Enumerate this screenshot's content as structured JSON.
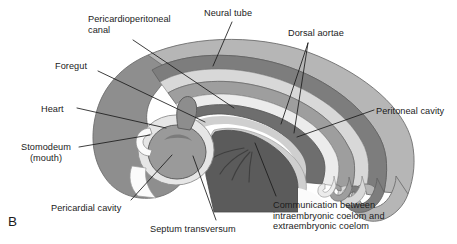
{
  "figure": {
    "panel_letter": "B",
    "background_color": "#ffffff",
    "width": 457,
    "height": 244
  },
  "palette": {
    "outer_ectoderm": "#b6b6b6",
    "mesoderm_body_wall": "#8e8e8e",
    "dark_tissue": "#6e6e6e",
    "septum_transversum": "#5e5e5e",
    "coelom_light": "#d6d6d6",
    "lumen_white": "#fbfbfb",
    "heart_fill": "#9a9a9a",
    "neural_tube_fill": "#9e9e9e",
    "outline": "#5a5a5a",
    "leader_line": "#1b1b1b",
    "text": "#1b1b1b"
  },
  "labels": [
    {
      "id": "pericardioperitoneal-canal",
      "text": "Pericardioperitoneal\ncanal",
      "x": 88,
      "y": 14,
      "align": "left"
    },
    {
      "id": "neural-tube",
      "text": "Neural tube",
      "x": 204,
      "y": 8,
      "align": "left"
    },
    {
      "id": "dorsal-aortae",
      "text": "Dorsal aortae",
      "x": 288,
      "y": 28,
      "align": "left"
    },
    {
      "id": "foregut",
      "text": "Foregut",
      "x": 55,
      "y": 61,
      "align": "left"
    },
    {
      "id": "heart",
      "text": "Heart",
      "x": 41,
      "y": 104,
      "align": "left"
    },
    {
      "id": "peritoneal-cavity",
      "text": "Peritoneal cavity",
      "x": 376,
      "y": 106,
      "align": "left"
    },
    {
      "id": "stomodeum",
      "text": "Stomodeum\n(mouth)",
      "x": 14,
      "y": 142,
      "align": "left"
    },
    {
      "id": "pericardial-cavity",
      "text": "Pericardial cavity",
      "x": 51,
      "y": 203,
      "align": "left"
    },
    {
      "id": "septum-transversum",
      "text": "Septum transversum",
      "x": 150,
      "y": 224,
      "align": "left"
    },
    {
      "id": "communication-coelom",
      "text": "Communication between\nintraembryonic coelom and\nextraembryonic coelom",
      "x": 273,
      "y": 200,
      "align": "left"
    }
  ],
  "leader_lines": [
    {
      "id": "leader-pericardioperitoneal-canal",
      "points": "133,40 234,108"
    },
    {
      "id": "leader-neural-tube",
      "points": "232,22 213,66"
    },
    {
      "id": "leader-dorsal-aortae-1",
      "points": "308,43 281,124"
    },
    {
      "id": "leader-dorsal-aortae-2",
      "points": "308,43 294,133"
    },
    {
      "id": "leader-foregut",
      "points": "98,71 205,122"
    },
    {
      "id": "leader-heart",
      "points": "77,108 166,128"
    },
    {
      "id": "leader-peritoneal-cavity",
      "points": "374,110 297,137"
    },
    {
      "id": "leader-stomodeum",
      "points": "79,147 150,135"
    },
    {
      "id": "leader-pericardial-cavity",
      "points": "131,200 172,155"
    },
    {
      "id": "leader-septum-transversum",
      "points": "216,220 193,156"
    },
    {
      "id": "leader-communication-coelom",
      "points": "276,196 255,143"
    }
  ]
}
